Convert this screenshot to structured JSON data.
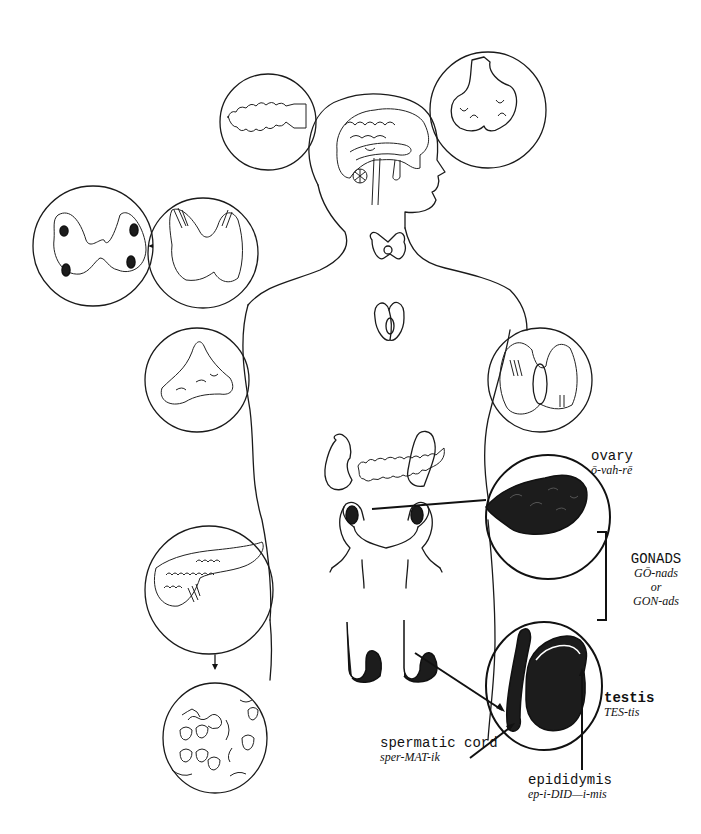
{
  "diagram": {
    "labels": {
      "ovary": {
        "term": "ovary",
        "pronunciation": "ō-vah-rē"
      },
      "gonads": {
        "term": "GONADS",
        "pronunciation_1": "GŌ-nads",
        "connector": "or",
        "pronunciation_2": "GON-ads"
      },
      "testis": {
        "term": "testis",
        "pronunciation": "TES-tis"
      },
      "spermatic_cord": {
        "term": "spermatic cord",
        "pronunciation": "sper-MAT-ik"
      },
      "epididymis": {
        "term": "epididymis",
        "pronunciation": "ep-i-DID—i-mis"
      }
    },
    "glands_illustrated": [
      "pineal gland (circle, upper left)",
      "pituitary gland (circle, upper right)",
      "brain (in head)",
      "thyroid gland (neck, and two detail circles at left)",
      "thymus (chest)",
      "parathyroid/thyroid posterior view (circle, right)",
      "adrenal gland (circle, left)",
      "adrenals and pancreas (abdomen)",
      "pancreas (circle, lower left)",
      "pancreatic islets (circle, bottom left)",
      "ovaries and uterus (pelvis)",
      "testes (below pelvis)",
      "ovary detail (circle, right)",
      "testis detail (circle, lower right)"
    ],
    "colors": {
      "ink": "#1a1a1a",
      "background": "#ffffff"
    }
  }
}
